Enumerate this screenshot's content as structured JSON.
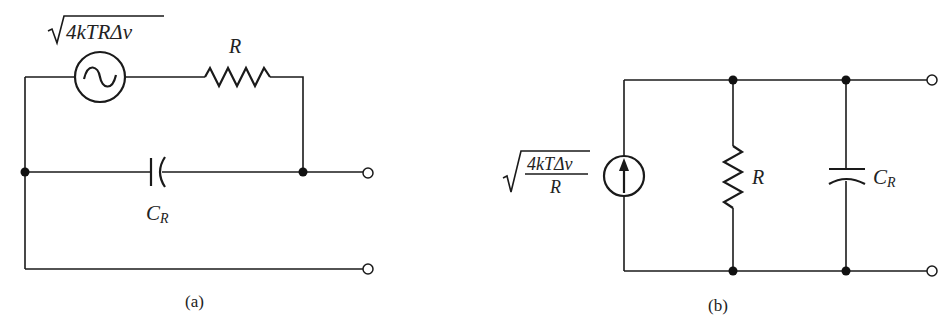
{
  "figure": {
    "panels": [
      {
        "caption": "(a)",
        "source_label": "4kTRΔν",
        "source_type": "ac-voltage-source",
        "resistor_label": "R",
        "capacitor_label_main": "C",
        "capacitor_label_sub": "R"
      },
      {
        "caption": "(b)",
        "source_label_numerator": "4kTΔν",
        "source_label_denominator": "R",
        "source_type": "current-source",
        "resistor_label": "R",
        "capacitor_label_main": "C",
        "capacitor_label_sub": "R"
      }
    ]
  }
}
